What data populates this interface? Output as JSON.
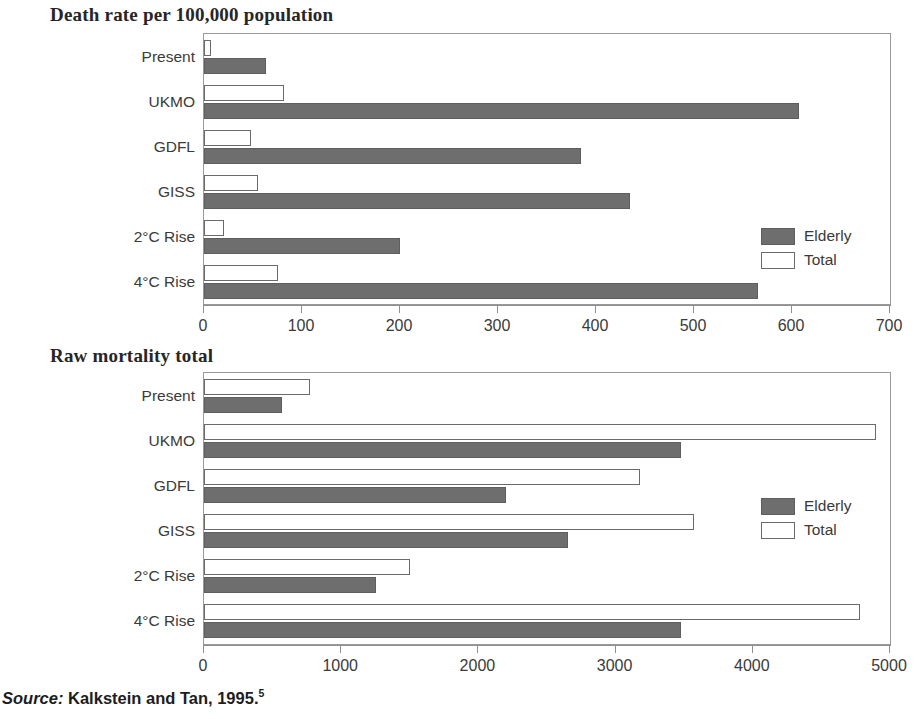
{
  "figure": {
    "source_prefix": "Source:",
    "source_text": "Kalkstein and Tan, 1995.",
    "source_superscript": "5",
    "colors": {
      "elderly_fill": "#6e6e6e",
      "total_fill": "#ffffff",
      "axis": "#8f8f8f",
      "text": "#3a3a3a"
    }
  },
  "chart_data": [
    {
      "type": "bar",
      "orientation": "horizontal",
      "title": "Death rate per 100,000 population",
      "xlabel": "",
      "ylabel": "",
      "xlim": [
        0,
        700
      ],
      "xticks": [
        0,
        100,
        200,
        300,
        400,
        500,
        600,
        700
      ],
      "xtick_labels": [
        "0",
        "100",
        "200",
        "300",
        "400",
        "500",
        "600",
        "700"
      ],
      "grid": false,
      "legend_position": "right-inside",
      "categories": [
        "Present",
        "UKMO",
        "GDFL",
        "GISS",
        "2°C Rise",
        "4°C Rise"
      ],
      "series": [
        {
          "name": "Total",
          "values": [
            7,
            82,
            48,
            55,
            20,
            76
          ]
        },
        {
          "name": "Elderly",
          "values": [
            63,
            607,
            385,
            435,
            200,
            565
          ]
        }
      ]
    },
    {
      "type": "bar",
      "orientation": "horizontal",
      "title": "Raw mortality total",
      "xlabel": "",
      "ylabel": "",
      "xlim": [
        0,
        5000
      ],
      "xticks": [
        0,
        1000,
        2000,
        3000,
        4000,
        5000
      ],
      "xtick_labels": [
        "0",
        "1000",
        "2000",
        "3000",
        "4000",
        "5000"
      ],
      "grid": false,
      "legend_position": "right-inside",
      "categories": [
        "Present",
        "UKMO",
        "GDFL",
        "GISS",
        "2°C Rise",
        "4°C Rise"
      ],
      "series": [
        {
          "name": "Total",
          "values": [
            770,
            4900,
            3180,
            3570,
            1500,
            4780
          ]
        },
        {
          "name": "Elderly",
          "values": [
            570,
            3480,
            2200,
            2650,
            1250,
            3480
          ]
        }
      ]
    }
  ]
}
